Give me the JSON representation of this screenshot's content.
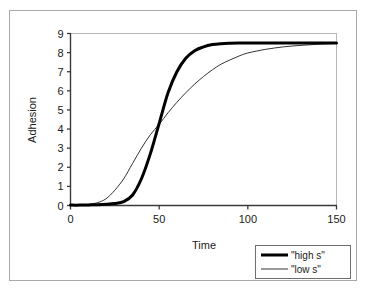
{
  "chart_data": {
    "type": "line",
    "title": "",
    "xlabel": "Time",
    "ylabel": "Adhesion",
    "xlim": [
      0,
      150
    ],
    "ylim": [
      0,
      9
    ],
    "xticks": [
      0,
      50,
      100,
      150
    ],
    "xtick_labels": [
      "0",
      "50",
      "100",
      "150"
    ],
    "yticks": [
      0,
      1,
      2,
      3,
      4,
      5,
      6,
      7,
      8,
      9
    ],
    "ytick_labels": [
      "0",
      "1",
      "2",
      "3",
      "4",
      "5",
      "6",
      "7",
      "8",
      "9"
    ],
    "grid": false,
    "legend_position": "bottom-right",
    "x": [
      0,
      5,
      10,
      15,
      20,
      25,
      30,
      35,
      40,
      45,
      50,
      55,
      60,
      65,
      70,
      75,
      80,
      85,
      90,
      95,
      100,
      110,
      120,
      130,
      140,
      150
    ],
    "series": [
      {
        "name": "\"high s\"",
        "style": "thick",
        "color": "#000000",
        "width": 3.0,
        "values": [
          0.02,
          0.02,
          0.03,
          0.04,
          0.06,
          0.1,
          0.2,
          0.55,
          1.4,
          2.7,
          4.3,
          5.9,
          7.0,
          7.7,
          8.1,
          8.3,
          8.42,
          8.47,
          8.49,
          8.5,
          8.5,
          8.5,
          8.5,
          8.5,
          8.5,
          8.5
        ]
      },
      {
        "name": "\"low s\"",
        "style": "thin",
        "color": "#333333",
        "width": 1.0,
        "values": [
          0.02,
          0.03,
          0.06,
          0.14,
          0.35,
          0.8,
          1.4,
          2.2,
          3.0,
          3.7,
          4.25,
          4.85,
          5.4,
          5.9,
          6.35,
          6.75,
          7.1,
          7.4,
          7.62,
          7.82,
          7.98,
          8.17,
          8.3,
          8.38,
          8.44,
          8.48
        ]
      }
    ],
    "legend_entries": [
      {
        "label": "\"high s\"",
        "style": "thick"
      },
      {
        "label": "\"low s\"",
        "style": "thin"
      }
    ]
  },
  "axes": {
    "y_title": "Adhesion",
    "x_title": "Time"
  }
}
